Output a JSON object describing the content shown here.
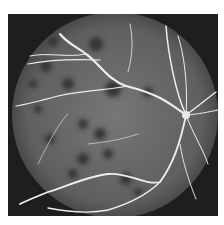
{
  "image": {
    "subject": "fundus fluorescein angiogram",
    "description": "Grayscale circular retinal angiography image showing bright branching vessels converging on the optic disc at right, with scattered dark hypofluorescent patches",
    "colors": {
      "background": "#ffffff",
      "frame": "#1e1e1e",
      "fundus_base": "#6a6a6a",
      "vessel": "#f2f2f2",
      "dark_spot": "#353535"
    }
  }
}
